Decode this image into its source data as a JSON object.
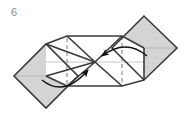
{
  "figure": {
    "step_number": "6",
    "caption_position": "top-left",
    "background_color": "#ffffff",
    "width": 190,
    "height": 124
  },
  "style": {
    "shaded_fill": "#d4d4d4",
    "white_fill": "#ffffff",
    "outline_dark": "#3a3a3a",
    "outline_mid": "#6e6e6e",
    "crease_light": "#c8c8c8",
    "dashed_line": "#7a7a7a",
    "arrow_color": "#111111",
    "step_label_color": "#8a8a8a"
  },
  "geometry": {
    "points": {
      "left_tip": "14,76",
      "left_bottom": "46,108",
      "left_top": "46,44",
      "mid_left_top": "67,36",
      "center": "95,62",
      "mid_right_bottom": "122,86",
      "right_top": "144,16",
      "right_tip": "177,48",
      "right_bottom": "144,80",
      "band_top_left": "67,36",
      "band_top_right": "122,36",
      "band_bottom_left": "67,86",
      "band_bottom_right": "122,86"
    },
    "dashed_verticals": [
      {
        "x": 67,
        "y1": 38,
        "y2": 86
      },
      {
        "x": 122,
        "y1": 36,
        "y2": 84
      }
    ],
    "horizontal_crease": {
      "x1": 14,
      "x2": 177,
      "y": 62
    }
  },
  "shapes": [
    {
      "name": "left-shaded-diamond",
      "fill": "shaded",
      "points": "14,76 46,44 78,76 46,108"
    },
    {
      "name": "right-shaded-diamond",
      "fill": "shaded",
      "points": "112,48 144,16 177,48 144,80"
    },
    {
      "name": "center-band-left-panel",
      "fill": "white",
      "points": "46,44 67,36 95,62 67,86 46,76"
    },
    {
      "name": "center-band-right-panel",
      "fill": "white",
      "points": "95,62 122,36 144,48 144,80 122,86"
    }
  ],
  "arrows": [
    {
      "name": "left-fold-arrow",
      "description": "curved arrow sweeping from lower-left up toward the center intersection",
      "start": "43,82",
      "control": "66,96",
      "end": "90,68",
      "head_direction": "up-right"
    },
    {
      "name": "right-fold-arrow",
      "description": "curved arrow sweeping from the right side left toward the center intersection",
      "start": "145,56",
      "control": "124,40",
      "end": "100,56",
      "head_direction": "down-left"
    }
  ],
  "labels": {
    "diagram_title": "Origami folding step",
    "action": "Fold both outer flaps inward to the center"
  }
}
